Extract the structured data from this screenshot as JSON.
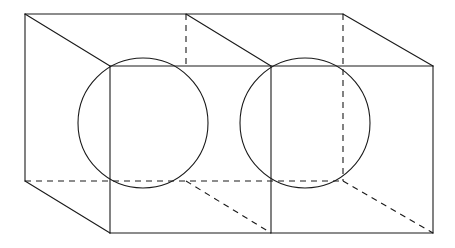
{
  "figure": {
    "type": "technical-line-drawing",
    "canvas": {
      "width": 455,
      "height": 248,
      "background": "#ffffff"
    },
    "style": {
      "visible_edge_color": "#1a1a1a",
      "hidden_edge_color": "#1a1a1a",
      "hidden_edge_dash": "6 5",
      "stroke_width": 1.1,
      "fill": "none"
    },
    "geometry": {
      "projection": "oblique",
      "front_face": {
        "left": 110,
        "right": 433,
        "top": 66,
        "bottom": 233
      },
      "back_face": {
        "left": 25,
        "right": 343,
        "top": 14,
        "bottom": 181
      },
      "depth_offset": {
        "dx": -85,
        "dy": -52
      },
      "divider_x_front": 271,
      "divider_x_back": 186
    },
    "circles": [
      {
        "name": "left-circle",
        "cx": 143,
        "cy": 123,
        "r": 65
      },
      {
        "name": "right-circle",
        "cx": 305,
        "cy": 123,
        "r": 65
      }
    ],
    "visible_edges": [
      {
        "name": "back-top-edge",
        "d": "M 25 14 L 343 14"
      },
      {
        "name": "back-left-edge",
        "d": "M 25 14 L 25 181"
      },
      {
        "name": "back-top-right-to-front-corner",
        "d": "M 343 14 L 433 66"
      },
      {
        "name": "back-top-left-to-front-corner",
        "d": "M 25 14 L 110 66"
      },
      {
        "name": "back-mid-top-to-front-mid",
        "d": "M 186 14 L 271 66"
      },
      {
        "name": "back-bottom-left-to-front-bottom-left",
        "d": "M 25 181 L 110 233"
      },
      {
        "name": "front-top-edge",
        "d": "M 110 66 L 433 66"
      },
      {
        "name": "front-bottom-edge",
        "d": "M 110 233 L 433 233"
      },
      {
        "name": "front-left-edge",
        "d": "M 110 66 L 110 233"
      },
      {
        "name": "front-right-edge",
        "d": "M 433 66 L 433 233"
      },
      {
        "name": "front-divider-edge",
        "d": "M 271 66 L 271 233"
      }
    ],
    "hidden_edges": [
      {
        "name": "back-bottom-edge",
        "d": "M 25 181 L 343 181"
      },
      {
        "name": "back-right-edge",
        "d": "M 343 14 L 343 181"
      },
      {
        "name": "back-divider-vertical",
        "d": "M 186 14 L 186 66"
      },
      {
        "name": "back-bottom-right-to-front-bottom-right",
        "d": "M 343 181 L 433 233"
      },
      {
        "name": "back-bottom-mid-to-front-bottom-mid",
        "d": "M 186 181 L 271 233"
      }
    ]
  }
}
